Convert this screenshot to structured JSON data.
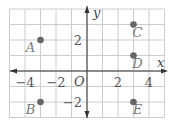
{
  "chart_data": {
    "type": "scatter",
    "title": "",
    "xlabel": "x",
    "ylabel": "y",
    "origin_label": "O",
    "xlim": [
      -5,
      5
    ],
    "ylim": [
      -3,
      4
    ],
    "grid": true,
    "x_ticks": [
      -4,
      -2,
      2,
      4
    ],
    "y_ticks": [
      2,
      -2
    ],
    "points": [
      {
        "label": "A",
        "x": -3,
        "y": 2
      },
      {
        "label": "B",
        "x": -3,
        "y": -2
      },
      {
        "label": "C",
        "x": 3,
        "y": 3
      },
      {
        "label": "D",
        "x": 3,
        "y": 1
      },
      {
        "label": "E",
        "x": 3,
        "y": -2
      }
    ]
  },
  "colors": {
    "grid": "#cccccc",
    "axis": "#333333",
    "point": "#666666"
  }
}
